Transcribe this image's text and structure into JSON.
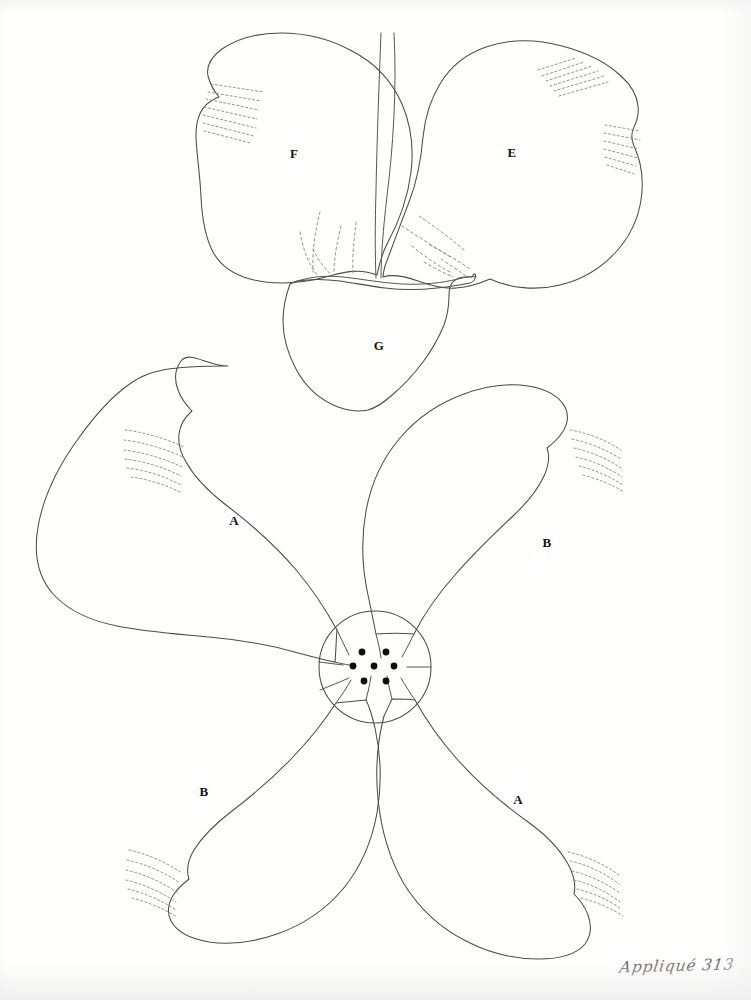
{
  "sheet": {
    "caption": "Appliqué 313",
    "background_color": "#fffffe",
    "ink_color": "#4a4a4a",
    "label_color": "#141414",
    "dot_color": "#0d0d0d"
  },
  "patterns": [
    {
      "id": "upper-flower",
      "name": "pansy-style two-petal motif with base",
      "pieces": [
        {
          "label": "F",
          "name": "upper-left-petal",
          "label_x": 294,
          "label_y": 154
        },
        {
          "label": "E",
          "name": "upper-right-petal",
          "label_x": 512,
          "label_y": 153
        },
        {
          "label": "G",
          "name": "lower-center-base",
          "label_x": 379,
          "label_y": 346
        }
      ]
    },
    {
      "id": "lower-flower",
      "name": "four-petal dogwood-style motif",
      "pieces": [
        {
          "label": "A",
          "name": "petal-upper-left",
          "label_x": 234,
          "label_y": 521
        },
        {
          "label": "B",
          "name": "petal-upper-right",
          "label_x": 547,
          "label_y": 543
        },
        {
          "label": "B",
          "name": "petal-lower-left",
          "label_x": 204,
          "label_y": 792
        },
        {
          "label": "A",
          "name": "petal-lower-right",
          "label_x": 518,
          "label_y": 800
        }
      ],
      "center": {
        "name": "flower-center-circle",
        "cx": 375,
        "cy": 667,
        "r": 56,
        "stamen_dots": 7,
        "dot_radius": 3.4,
        "dots": [
          {
            "x": 362,
            "y": 652
          },
          {
            "x": 386,
            "y": 652
          },
          {
            "x": 353,
            "y": 666
          },
          {
            "x": 374,
            "y": 666
          },
          {
            "x": 394,
            "y": 666
          },
          {
            "x": 364,
            "y": 681
          },
          {
            "x": 386,
            "y": 681
          }
        ]
      }
    }
  ],
  "stitch_marks": {
    "name": "dotted-shading-hatch-groups",
    "style": "dashed parallel arcs indicating stitch / shading direction",
    "group_count": 7
  }
}
